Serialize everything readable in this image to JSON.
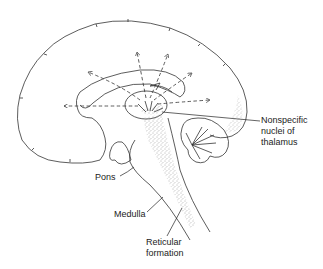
{
  "figure": {
    "type": "anatomical-diagram",
    "labels": {
      "thalamus": [
        "Nonspecific",
        "nuclei of",
        "thalamus"
      ],
      "pons": "Pons",
      "medulla": "Medulla",
      "reticular": [
        "Reticular",
        "formation"
      ]
    },
    "colors": {
      "line": "#333333",
      "text": "#222222",
      "stipple": "#555555",
      "background": "#ffffff"
    }
  }
}
